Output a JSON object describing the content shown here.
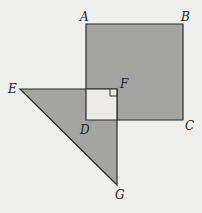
{
  "diagram": {
    "background": "#efefed",
    "shade_color": "#a4a4a2",
    "inner_fill": "#ecebe8",
    "stroke_color": "#2a2a2a",
    "square_ABCD": {
      "vertices": {
        "A": [
          86,
          24
        ],
        "B": [
          183,
          24
        ],
        "C": [
          183,
          120
        ],
        "D": [
          86,
          120
        ]
      }
    },
    "triangle_EFG": {
      "vertices": {
        "E": [
          20,
          89
        ],
        "F": [
          117,
          89
        ],
        "G": [
          117,
          185
        ]
      }
    },
    "overlap_square": {
      "corners": [
        [
          86,
          89
        ],
        [
          117,
          89
        ],
        [
          117,
          120
        ],
        [
          86,
          120
        ]
      ]
    },
    "right_angle_at": "F",
    "labels": [
      {
        "text": "A",
        "x": 80,
        "y": 21
      },
      {
        "text": "B",
        "x": 181,
        "y": 21
      },
      {
        "text": "C",
        "x": 185,
        "y": 129
      },
      {
        "text": "D",
        "x": 80,
        "y": 133
      },
      {
        "text": "E",
        "x": 8,
        "y": 92
      },
      {
        "text": "F",
        "x": 120,
        "y": 88
      },
      {
        "text": "G",
        "x": 115,
        "y": 198
      }
    ]
  }
}
